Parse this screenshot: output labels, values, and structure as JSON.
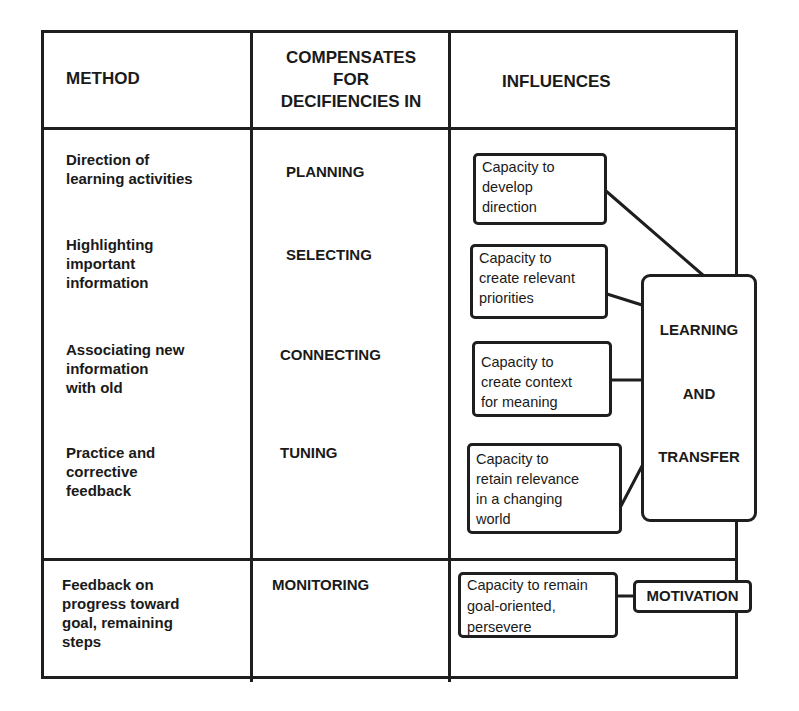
{
  "table": {
    "headers": {
      "method": "METHOD",
      "compensates": "COMPENSATES\nFOR\nDECIFIENCIES IN",
      "compensates_lines": [
        "COMPENSATES",
        "FOR",
        "DECIFIENCIES IN"
      ],
      "influences": "INFLUENCES"
    },
    "rows": [
      {
        "method": "Direction of\nlearning activities",
        "compensates": "PLANNING",
        "influence": "Capacity to\ndevelop\ndirection"
      },
      {
        "method": "Highlighting\nimportant\ninformation",
        "compensates": "SELECTING",
        "influence": "Capacity to\ncreate relevant\npriorities"
      },
      {
        "method": "Associating new\ninformation\nwith old",
        "compensates": "CONNECTING",
        "influence": "Capacity to\ncreate context\nfor meaning"
      },
      {
        "method": "Practice and\ncorrective\nfeedback",
        "compensates": "TUNING",
        "influence": "Capacity to\nretain relevance\nin a changing\nworld"
      }
    ],
    "monitoring_row": {
      "method": "Feedback on\nprogress toward\ngoal, remaining\nsteps",
      "compensates": "MONITORING",
      "influence": "Capacity to remain\n goal-oriented,\npersevere"
    }
  },
  "outcomes": {
    "learning_transfer": [
      "LEARNING",
      "AND",
      "TRANSFER"
    ],
    "motivation": "MOTIVATION"
  },
  "colors": {
    "line": "#1e1e1e",
    "background": "#ffffff",
    "text": "#1a1a1a"
  }
}
